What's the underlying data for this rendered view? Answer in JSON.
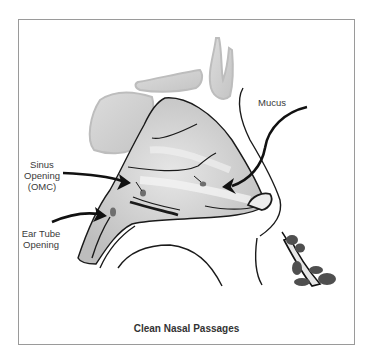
{
  "diagram": {
    "title": "Clean Nasal Passages",
    "labels": {
      "mucus": "Mucus",
      "sinus_opening_line1": "Sinus",
      "sinus_opening_line2": "Opening",
      "sinus_opening_line3": "(OMC)",
      "ear_tube_line1": "Ear Tube",
      "ear_tube_line2": "Opening"
    },
    "colors": {
      "frame": "#9a9a9a",
      "tissue": "#c8c8c8",
      "bone": "#d2d2d2",
      "outline": "#1a1a1a",
      "mucus_drop": "#6e6e6e"
    }
  }
}
